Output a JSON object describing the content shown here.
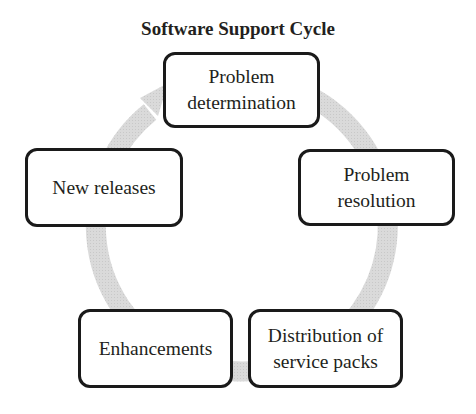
{
  "title": "Software Support Cycle",
  "colors": {
    "arc": "#d6d6d6",
    "box_border": "#1a1a1a",
    "text": "#231f20"
  },
  "nodes": [
    {
      "id": "problem-determination",
      "label": "Problem\ndetermination"
    },
    {
      "id": "problem-resolution",
      "label": "Problem\nresolution"
    },
    {
      "id": "distribution-of-service-packs",
      "label": "Distribution of\nservice packs"
    },
    {
      "id": "enhancements",
      "label": "Enhancements"
    },
    {
      "id": "new-releases",
      "label": "New releases"
    }
  ],
  "flow": {
    "direction": "clockwise",
    "arrow_points_to": "Problem determination"
  }
}
